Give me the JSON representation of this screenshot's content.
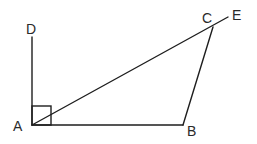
{
  "diagram": {
    "type": "geometry",
    "background": "#ffffff",
    "line_color": "#1e1e1e",
    "points": {
      "A": {
        "label": "A",
        "x": 32,
        "y": 125,
        "label_x": 13,
        "label_y": 131
      },
      "B": {
        "label": "B",
        "x": 183,
        "y": 125,
        "label_x": 187,
        "label_y": 136
      },
      "C": {
        "label": "C",
        "x": 213,
        "y": 27,
        "label_x": 202,
        "label_y": 23
      },
      "D": {
        "label": "D",
        "x": 32,
        "y": 37,
        "label_x": 26,
        "label_y": 34
      },
      "E": {
        "label": "E",
        "x": 228,
        "y": 17,
        "label_x": 232,
        "label_y": 20
      }
    },
    "segments": [
      {
        "from": "A",
        "to": "D"
      },
      {
        "from": "A",
        "to": "B"
      },
      {
        "from": "A",
        "to": "E"
      },
      {
        "from": "B",
        "to": "C"
      }
    ],
    "right_angle_marker": {
      "at": "A",
      "between": [
        "D",
        "B"
      ],
      "size": 19
    }
  }
}
